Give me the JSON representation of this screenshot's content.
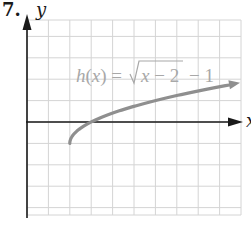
{
  "problem_number": "7.",
  "chart_data": {
    "type": "line",
    "title": "",
    "function_label": "h(x) = √(x − 2) − 1",
    "function_label_parts": {
      "lhs": "h(x) =",
      "radicand": "x − 2",
      "tail": "− 1"
    },
    "xlabel": "x",
    "ylabel": "y",
    "xlim": [
      0,
      10
    ],
    "ylim": [
      -4.5,
      4.7
    ],
    "grid": true,
    "grid_step": 1,
    "legend": "none",
    "tick_labels": "none",
    "series": [
      {
        "name": "h(x)",
        "x": [
          2,
          2.25,
          2.5,
          3,
          4,
          5,
          6,
          7,
          8,
          9,
          10
        ],
        "values": [
          -1,
          -0.5,
          -0.29,
          0,
          0.41,
          0.73,
          1,
          1.24,
          1.45,
          1.65,
          1.83
        ],
        "color": "#8f8f8f",
        "end_arrow": true
      }
    ]
  },
  "colors": {
    "grid": "#d4d4d4",
    "axis": "#1a1a1a",
    "curve": "#8f8f8f",
    "label": "#a8a8a8"
  }
}
